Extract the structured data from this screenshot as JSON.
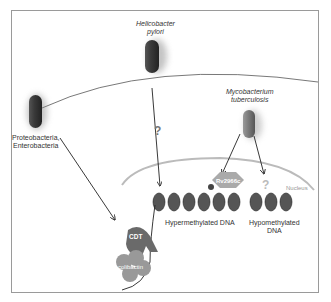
{
  "diagram": {
    "bacteria": [
      {
        "id": "hpylori",
        "label_line1": "Helicobacter",
        "label_line2": "pylori",
        "italic": true
      },
      {
        "id": "proteo",
        "label_line1": "Proteobacteria,",
        "label_line2": "Enterobacteria",
        "italic": false
      },
      {
        "id": "mtb",
        "label_line1": "Mycobacterium",
        "label_line2": "tuberculosis",
        "italic": true
      }
    ],
    "proteins": {
      "cdt": "CDT",
      "colibactin": "colibactin",
      "rv": "Rv2966c"
    },
    "question_marks": [
      "?",
      "?"
    ],
    "compartments": {
      "nucleus": "Nucleus"
    },
    "dna_labels": {
      "hyper": "Hypermethylated DNA",
      "hypo_line1": "Hypomethylated",
      "hypo_line2": "DNA"
    },
    "colors": {
      "bacterium_dark": "#3a3a3a",
      "bacterium_mid": "#7a7a7a",
      "protein_dark": "#6a6a6a",
      "protein_light": "#9a9a9a",
      "question": "#777777",
      "nucleus_text": "#999999"
    }
  }
}
